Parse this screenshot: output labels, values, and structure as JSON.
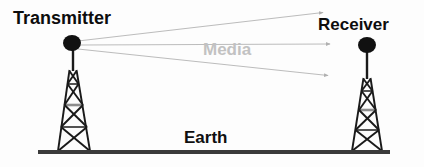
{
  "diagram": {
    "background_color": "#fdfdfd",
    "labels": {
      "transmitter": "Transmitter",
      "receiver": "Receiver",
      "media": "Media",
      "earth": "Earth"
    },
    "colors": {
      "text_dark": "#0d0d0d",
      "text_media_gray": "#c2c2c2",
      "tower_stroke": "#1a1a1a",
      "signal_line": "#b8b8b8",
      "ground_line": "#3b3b3b",
      "antenna_dot": "#111111"
    },
    "towers": [
      {
        "name": "transmitter-tower",
        "mast_top_y": 47,
        "apex_x": 73,
        "base_left_x": 58,
        "base_right_x": 90,
        "base_y": 151,
        "lattice_top_y": 70,
        "lattice_top_half_width": 4
      },
      {
        "name": "receiver-tower",
        "mast_top_y": 50,
        "apex_x": 367,
        "base_left_x": 352,
        "base_right_x": 382,
        "base_y": 151,
        "lattice_top_y": 78,
        "lattice_top_half_width": 4
      }
    ],
    "antennas": [
      {
        "name": "transmitter-antenna-dot",
        "cx": 72,
        "cy": 43,
        "rx": 9,
        "ry": 8
      },
      {
        "name": "receiver-antenna-dot",
        "cx": 367,
        "cy": 45,
        "rx": 9,
        "ry": 8
      }
    ],
    "signal_paths": [
      {
        "name": "signal-ray-upper",
        "x1": 78,
        "y1": 41,
        "x2": 325,
        "y2": 12
      },
      {
        "name": "signal-ray-direct",
        "x1": 80,
        "y1": 45,
        "x2": 332,
        "y2": 44
      },
      {
        "name": "signal-ray-lower",
        "x1": 78,
        "y1": 49,
        "x2": 330,
        "y2": 76
      }
    ],
    "ground": {
      "name": "earth-ground-line",
      "x1": 38,
      "x2": 390,
      "y": 152,
      "thickness": 4
    }
  }
}
